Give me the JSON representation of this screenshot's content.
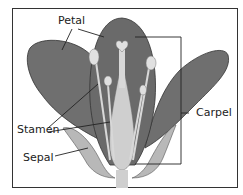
{
  "diagram": {
    "labels": {
      "petal": "Petal",
      "stamen": "Stamen",
      "sepal": "Sepal",
      "carpel": "Carpel"
    },
    "colors": {
      "petal": "#6f6f6f",
      "petal_dark": "#555555",
      "sepal": "#b8b8b8",
      "carpel": "#cfcfcf",
      "stamen": "#d8d8d8",
      "line": "#222222",
      "frame": "#333333"
    }
  }
}
